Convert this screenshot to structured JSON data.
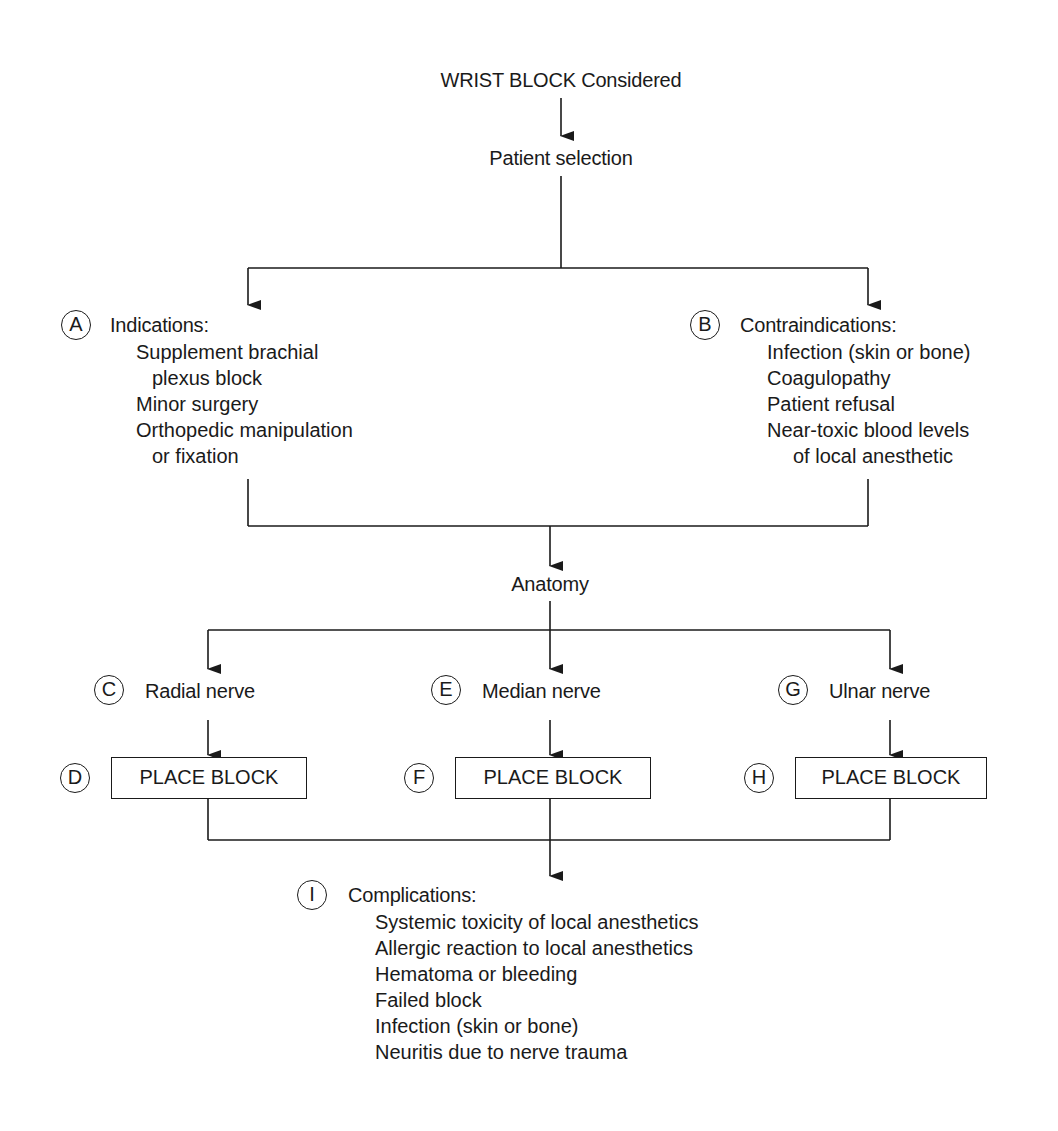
{
  "title": "WRIST BLOCK Considered",
  "step_patient_selection": "Patient selection",
  "indications": {
    "marker": "A",
    "heading": "Indications:",
    "items": [
      "Supplement brachial",
      "plexus block",
      "Minor surgery",
      "Orthopedic manipulation",
      "or fixation"
    ]
  },
  "contraindications": {
    "marker": "B",
    "heading": "Contraindications:",
    "items": [
      "Infection (skin or bone)",
      "Coagulopathy",
      "Patient refusal",
      "Near-toxic blood levels",
      "of local anesthetic"
    ]
  },
  "anatomy": "Anatomy",
  "nerves": [
    {
      "marker": "C",
      "label": "Radial nerve",
      "block_marker": "D",
      "block_label": "PLACE BLOCK"
    },
    {
      "marker": "E",
      "label": "Median nerve",
      "block_marker": "F",
      "block_label": "PLACE BLOCK"
    },
    {
      "marker": "G",
      "label": "Ulnar nerve",
      "block_marker": "H",
      "block_label": "PLACE BLOCK"
    }
  ],
  "complications": {
    "marker": "I",
    "heading": "Complications:",
    "items": [
      "Systemic toxicity of local anesthetics",
      "Allergic reaction to local anesthetics",
      "Hematoma or bleeding",
      "Failed block",
      "Infection (skin or bone)",
      "Neuritis due to nerve trauma"
    ]
  }
}
